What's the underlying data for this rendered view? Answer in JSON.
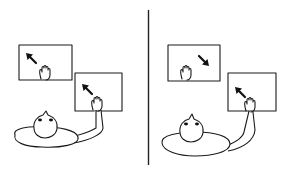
{
  "figure": {
    "colors": {
      "line": "#1a1a1a",
      "background": "#ffffff"
    },
    "panels": [
      {
        "id": "left",
        "screens": [
          {
            "id": "screen-1",
            "arrow_direction": "up-left",
            "hand": "resting"
          },
          {
            "id": "screen-2",
            "arrow_direction": "up-left",
            "hand": "touching"
          }
        ]
      },
      {
        "id": "right",
        "screens": [
          {
            "id": "screen-1",
            "arrow_direction": "up-right",
            "hand": "resting"
          },
          {
            "id": "screen-2",
            "arrow_direction": "up-left",
            "hand": "touching"
          }
        ]
      }
    ],
    "divider": "vertical line"
  }
}
